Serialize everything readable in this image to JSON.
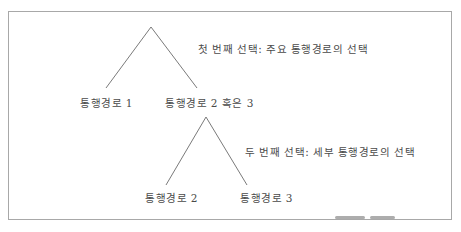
{
  "figure": {
    "caption_fragment": "",
    "stroke_color": "#7a7a7a",
    "frame_color": "#a8a8a8"
  },
  "tree": {
    "root": {
      "annotation": "첫 번째 선택: 주요 통행경로의 선택",
      "children": [
        {
          "label": "통행경로 1"
        },
        {
          "label": "통행경로 2 혹은 3"
        }
      ]
    },
    "sub": {
      "annotation": "두 번째 선택: 세부 통행경로의 선택",
      "children": [
        {
          "label": "통행경로 2"
        },
        {
          "label": "통행경로 3"
        }
      ]
    }
  }
}
